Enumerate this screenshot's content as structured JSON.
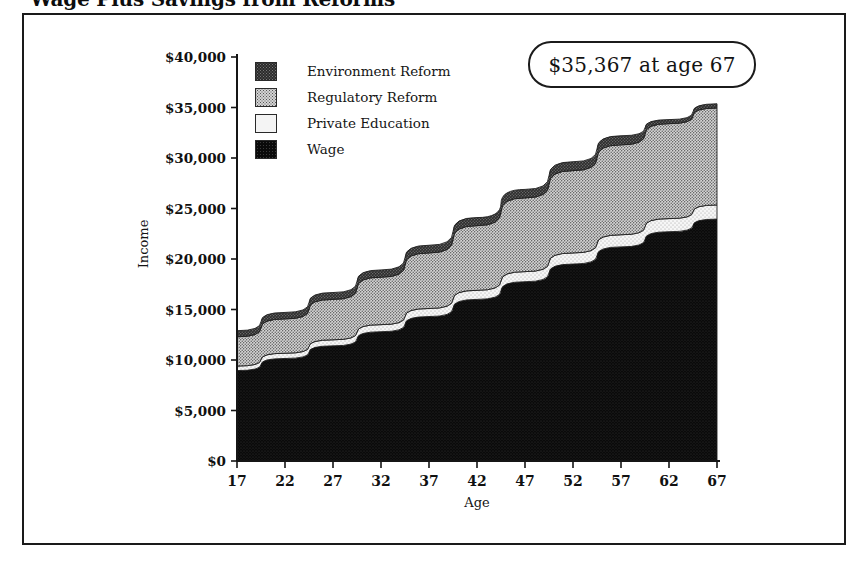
{
  "title": "Wage Plus Savings from Reforms",
  "callout": {
    "text": "$35,367 at age 67"
  },
  "legend": {
    "items": [
      {
        "label": "Environment Reform",
        "swatch": "env"
      },
      {
        "label": "Regulatory Reform",
        "swatch": "reg"
      },
      {
        "label": "Private Education",
        "swatch": "priv"
      },
      {
        "label": "Wage",
        "swatch": "wage"
      }
    ]
  },
  "axes": {
    "ylabel": "Income",
    "xlabel": "Age",
    "yticks": [
      "$0",
      "$5,000",
      "$10,000",
      "$15,000",
      "$20,000",
      "$25,000",
      "$30,000",
      "$35,000",
      "$40,000"
    ],
    "xticks": [
      "17",
      "22",
      "27",
      "32",
      "37",
      "42",
      "47",
      "52",
      "57",
      "62",
      "67"
    ]
  },
  "colors": {
    "environment_reform": "#2b2b2b",
    "regulatory_reform": "#d3d3d3",
    "private_education": "#f4f4f4",
    "wage": "#0a0a0a",
    "frame": "#1a1a1a",
    "background": "#ffffff"
  },
  "chart_data": {
    "type": "area",
    "title": "Wage Plus Savings from Reforms",
    "xlabel": "Age",
    "ylabel": "Income",
    "xlim": [
      17,
      67
    ],
    "ylim": [
      0,
      40000
    ],
    "grid": false,
    "legend_position": "upper-left-inside",
    "stacked": true,
    "annotation": "$35,367 at age 67",
    "x": [
      17,
      22,
      27,
      32,
      37,
      42,
      47,
      52,
      57,
      62,
      67
    ],
    "series": [
      {
        "name": "Wage",
        "values": [
          8950,
          10150,
          11400,
          12800,
          14300,
          16000,
          17750,
          19500,
          21200,
          22700,
          23950
        ]
      },
      {
        "name": "Private Education",
        "values": [
          450,
          520,
          600,
          700,
          800,
          900,
          1000,
          1100,
          1200,
          1300,
          1400
        ]
      },
      {
        "name": "Regulatory Reform",
        "values": [
          2900,
          3400,
          4000,
          4700,
          5500,
          6400,
          7300,
          8150,
          8900,
          9400,
          9600
        ]
      },
      {
        "name": "Environment Reform",
        "values": [
          600,
          640,
          680,
          720,
          760,
          800,
          840,
          880,
          900,
          400,
          417
        ]
      }
    ],
    "totals": [
      12900,
      14710,
      16680,
      18920,
      21360,
      24100,
      26890,
      29630,
      32200,
      33800,
      35367
    ]
  }
}
